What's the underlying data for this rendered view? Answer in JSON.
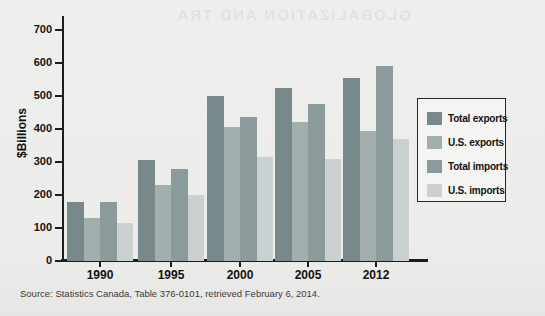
{
  "page": {
    "ghost_text": "GLOBALIZATION AND TRA",
    "background_color": "#ecedea"
  },
  "source_line": "Source: Statistics Canada, Table 376-0101, retrieved February 6, 2014.",
  "chart_data": {
    "type": "bar",
    "title": "",
    "xlabel": "",
    "ylabel": "$Billions",
    "categories": [
      "1990",
      "1995",
      "2000",
      "2005",
      "2012"
    ],
    "series": [
      {
        "name": "Total exports",
        "color": "#78898b",
        "values": [
          180,
          305,
          500,
          525,
          555
        ]
      },
      {
        "name": "U.S. exports",
        "color": "#a3afaf",
        "values": [
          130,
          230,
          405,
          420,
          395
        ]
      },
      {
        "name": "Total imports",
        "color": "#8b9b9c",
        "values": [
          180,
          280,
          435,
          475,
          590
        ]
      },
      {
        "name": "U.S. imports",
        "color": "#cad1d0",
        "values": [
          115,
          200,
          315,
          310,
          370
        ]
      }
    ],
    "ylim": [
      0,
      700
    ],
    "yticks": [
      0,
      100,
      200,
      300,
      400,
      500,
      600,
      700
    ],
    "grid": false,
    "legend_position": "right",
    "axis_color": "#1c1c1c"
  }
}
